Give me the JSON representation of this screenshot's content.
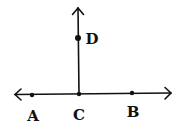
{
  "diagram": {
    "stroke_color": "#111111",
    "background": "#ffffff",
    "line": {
      "label": "line AB",
      "arrows": "both",
      "x1": 15,
      "y1": 94,
      "x2": 171,
      "y2": 93
    },
    "ray": {
      "label": "ray CD",
      "arrows": "end",
      "x1": 79,
      "y1": 94,
      "x2": 78,
      "y2": 8
    },
    "points": [
      {
        "name": "A",
        "x": 32,
        "y": 95,
        "label_x": 33,
        "label_y": 121
      },
      {
        "name": "C",
        "x": 79,
        "y": 94,
        "label_x": 79,
        "label_y": 120
      },
      {
        "name": "B",
        "x": 132,
        "y": 93,
        "label_x": 133,
        "label_y": 117
      },
      {
        "name": "D",
        "x": 78,
        "y": 38,
        "label_x": 92,
        "label_y": 44
      }
    ]
  }
}
